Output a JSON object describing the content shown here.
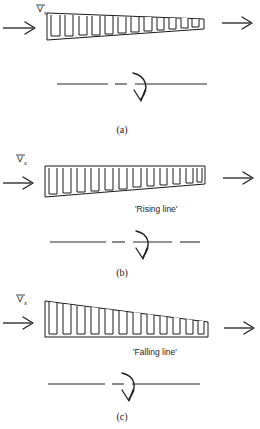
{
  "figure": {
    "panels": [
      {
        "id": "a",
        "caption": "(a)",
        "inlet_label": "V",
        "inlet_sublabel": "x",
        "annotation": "",
        "taper": "top-flat-bottom-descending",
        "tooth_count": 11,
        "inlet_arrow": "arrow-right",
        "outlet_arrow": "arrow-right",
        "rotation_arrow": "curved-down-arrow",
        "centerline": "dash-dot-dash"
      },
      {
        "id": "b",
        "caption": "(b)",
        "inlet_label": "V",
        "inlet_sublabel": "x",
        "annotation": "'Rising line'",
        "taper": "top-flat-bottom-rising",
        "tooth_count": 11,
        "inlet_arrow": "arrow-right",
        "outlet_arrow": "arrow-right",
        "rotation_arrow": "curved-down-arrow",
        "centerline": "dash-dot-dash"
      },
      {
        "id": "c",
        "caption": "(c)",
        "inlet_label": "V",
        "inlet_sublabel": "x",
        "annotation": "'Falling line'",
        "taper": "top-descending-bottom-flat",
        "tooth_count": 11,
        "inlet_arrow": "arrow-right",
        "outlet_arrow": "arrow-right",
        "rotation_arrow": "curved-down-arrow",
        "centerline": "dash-dot-dash"
      }
    ],
    "colors": {
      "ink": "#1a1a1a",
      "background": "#ffffff"
    }
  }
}
